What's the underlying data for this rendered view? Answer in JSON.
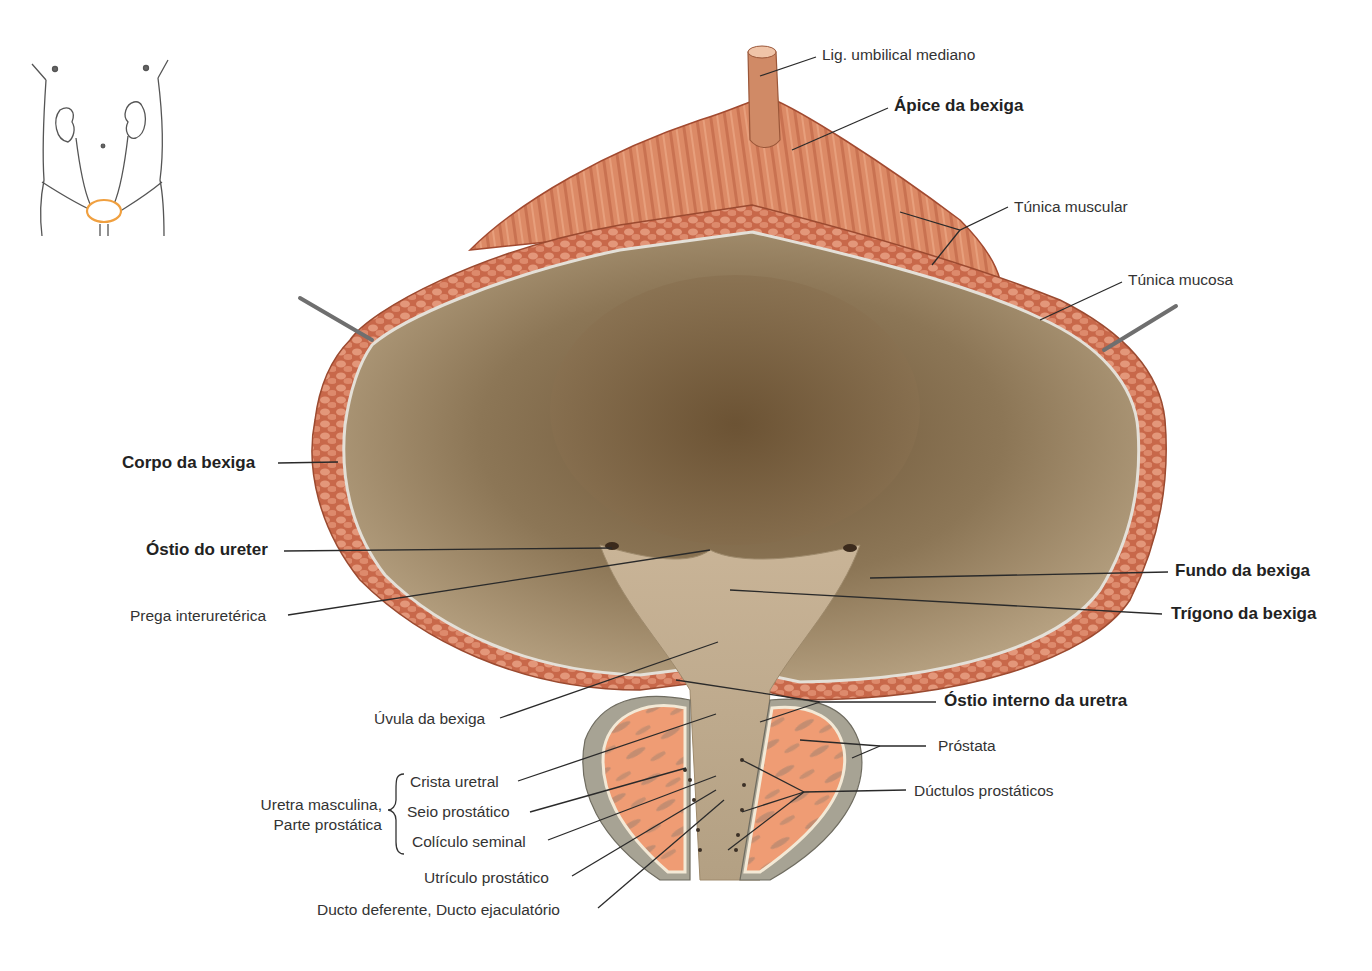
{
  "figure": {
    "colors": {
      "muscle": "#d9805e",
      "muscle_dark": "#b8583c",
      "mucosa_interior": "#7d6447",
      "mucosa_light": "#b9a282",
      "prostate_cut": "#ee9a72",
      "prostate_capsule": "#a9a596",
      "hook": "#777777",
      "leader_line": "#2a2a2a",
      "orientation_highlight": "#f0a040"
    },
    "orientation_inset": {
      "description": "Contorno do tronco com rins, ureteres e bexiga destacada em laranja"
    }
  },
  "labels": {
    "lig_umbilical": "Lig. umbilical mediano",
    "apice": "Ápice da bexiga",
    "tunica_muscular": "Túnica muscular",
    "tunica_mucosa": "Túnica mucosa",
    "corpo": "Corpo da bexiga",
    "ostio_ureter": "Óstio do ureter",
    "prega": "Prega interuretérica",
    "fundo": "Fundo da bexiga",
    "trigono": "Trígono da bexiga",
    "ostio_interno": "Óstio interno da uretra",
    "uvula": "Úvula da bexiga",
    "prostata": "Próstata",
    "ductulos": "Dúctulos prostáticos",
    "uretra_group_line1": "Uretra masculina,",
    "uretra_group_line2": "Parte prostática",
    "crista": "Crista uretral",
    "seio": "Seio prostático",
    "coliculo": "Colículo seminal",
    "utriculo": "Utrículo prostático",
    "ducto": "Ducto deferente, Ducto ejaculatório"
  }
}
